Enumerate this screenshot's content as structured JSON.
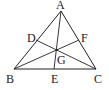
{
  "diagram": {
    "type": "geometry-triangle",
    "stroke_color": "#222222",
    "background": "#ffffff",
    "points": {
      "A": {
        "x": 61,
        "y": 11,
        "label": "A",
        "lx": 56,
        "ly": 9
      },
      "B": {
        "x": 14,
        "y": 69,
        "label": "B",
        "lx": 6,
        "ly": 83
      },
      "C": {
        "x": 96,
        "y": 69,
        "label": "C",
        "lx": 94,
        "ly": 83
      },
      "D": {
        "x": 36,
        "y": 40,
        "label": "D",
        "lx": 27,
        "ly": 42
      },
      "E": {
        "x": 54,
        "y": 69,
        "label": "E",
        "lx": 51,
        "ly": 83
      },
      "F": {
        "x": 79,
        "y": 40,
        "label": "F",
        "lx": 81,
        "ly": 42
      },
      "G": {
        "x": 57,
        "y": 50,
        "label": "G",
        "lx": 57,
        "ly": 64
      }
    },
    "segments": [
      {
        "from": "A",
        "to": "B"
      },
      {
        "from": "B",
        "to": "C"
      },
      {
        "from": "C",
        "to": "A"
      },
      {
        "from": "A",
        "to": "E"
      },
      {
        "from": "B",
        "to": "F"
      },
      {
        "from": "C",
        "to": "D"
      }
    ]
  }
}
